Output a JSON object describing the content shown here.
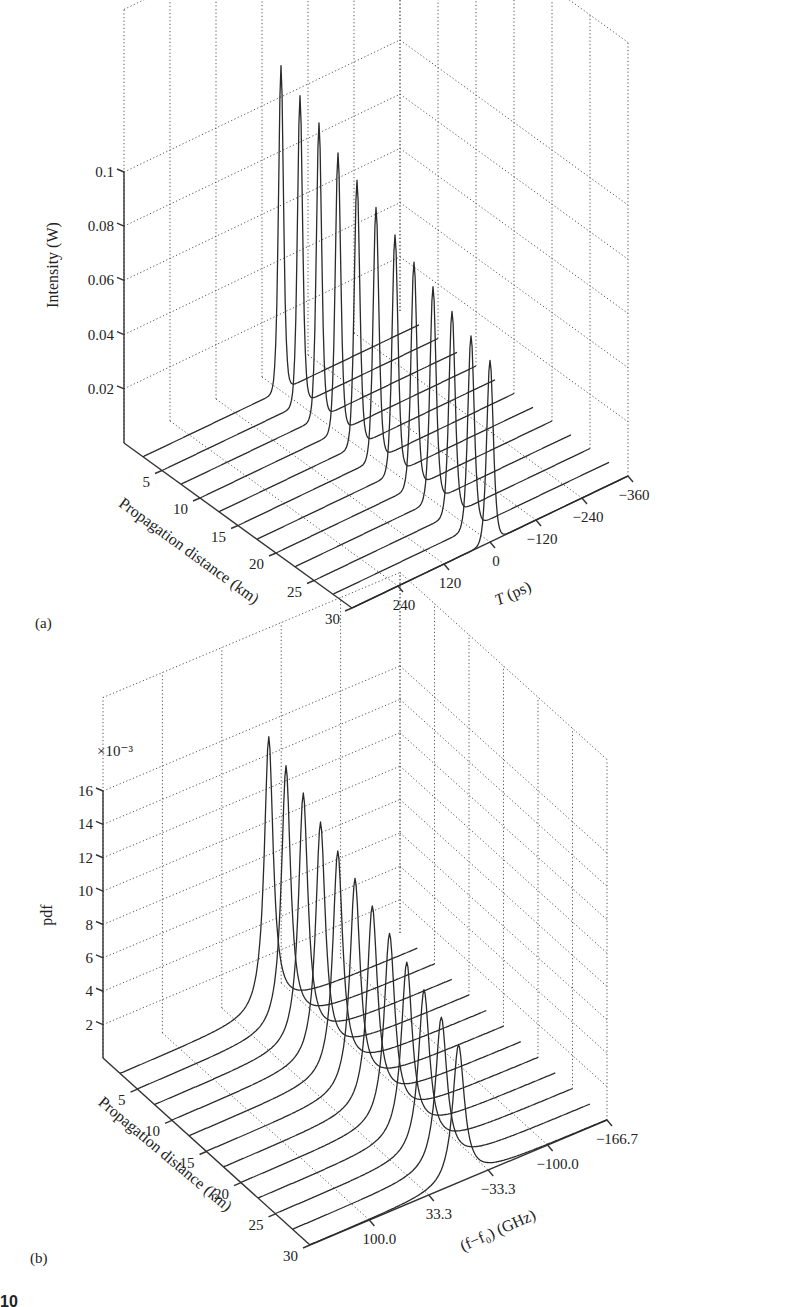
{
  "chart_data": [
    {
      "type": "waterfall-3d",
      "panel": "(a)",
      "zlabel": "Intensity (W)",
      "ylabel": "Propagation distance (km)",
      "xlabel": "T (ps)",
      "z_ticks": [
        "0.02",
        "0.04",
        "0.06",
        "0.08",
        "0.1"
      ],
      "z_tick_values": [
        0.02,
        0.04,
        0.06,
        0.08,
        0.1
      ],
      "y_ticks": [
        "5",
        "10",
        "15",
        "20",
        "25",
        "30"
      ],
      "x_ticks": [
        "240",
        "120",
        "0",
        "−120",
        "−240",
        "−360"
      ],
      "zlim": [
        0,
        0.1
      ],
      "ylim": [
        0,
        30
      ],
      "xlim": [
        360,
        -360
      ],
      "series": [
        {
          "distance_km": 2.5,
          "peak_W": 0.12,
          "center_ps": 0
        },
        {
          "distance_km": 5.0,
          "peak_W": 0.114,
          "center_ps": 0
        },
        {
          "distance_km": 7.5,
          "peak_W": 0.109,
          "center_ps": 0
        },
        {
          "distance_km": 10.0,
          "peak_W": 0.103,
          "center_ps": 0
        },
        {
          "distance_km": 12.5,
          "peak_W": 0.098,
          "center_ps": 0
        },
        {
          "distance_km": 15.0,
          "peak_W": 0.093,
          "center_ps": 0
        },
        {
          "distance_km": 17.5,
          "peak_W": 0.088,
          "center_ps": 0
        },
        {
          "distance_km": 20.0,
          "peak_W": 0.083,
          "center_ps": 0
        },
        {
          "distance_km": 22.5,
          "peak_W": 0.079,
          "center_ps": 0
        },
        {
          "distance_km": 25.0,
          "peak_W": 0.075,
          "center_ps": 0
        },
        {
          "distance_km": 27.5,
          "peak_W": 0.071,
          "center_ps": 0
        },
        {
          "distance_km": 30.0,
          "peak_W": 0.067,
          "center_ps": 0
        }
      ],
      "grid": true
    },
    {
      "type": "waterfall-3d",
      "panel": "(b)",
      "zlabel": "pdf",
      "z_multiplier": "×10⁻³",
      "ylabel": "Propagation distance (km)",
      "xlabel": "(f−f₀) (GHz)",
      "z_ticks": [
        "2",
        "4",
        "6",
        "8",
        "10",
        "12",
        "14",
        "16"
      ],
      "z_tick_values": [
        2,
        4,
        6,
        8,
        10,
        12,
        14,
        16
      ],
      "y_ticks": [
        "5",
        "10",
        "15",
        "20",
        "25",
        "30"
      ],
      "x_ticks": [
        "100.0",
        "33.3",
        "−33.3",
        "−100.0",
        "−166.7"
      ],
      "zlim": [
        0,
        18
      ],
      "ylim": [
        0,
        30
      ],
      "xlim": [
        166.7,
        -166.7
      ],
      "series": [
        {
          "distance_km": 2.5,
          "peak_e3": 18.5,
          "center_GHz": 0
        },
        {
          "distance_km": 5.0,
          "peak_e3": 17.6,
          "center_GHz": 0
        },
        {
          "distance_km": 7.5,
          "peak_e3": 16.8,
          "center_GHz": 0
        },
        {
          "distance_km": 10.0,
          "peak_e3": 15.9,
          "center_GHz": 0
        },
        {
          "distance_km": 12.5,
          "peak_e3": 15.0,
          "center_GHz": 0
        },
        {
          "distance_km": 15.0,
          "peak_e3": 14.2,
          "center_GHz": 0
        },
        {
          "distance_km": 17.5,
          "peak_e3": 13.4,
          "center_GHz": 0
        },
        {
          "distance_km": 20.0,
          "peak_e3": 12.6,
          "center_GHz": 0
        },
        {
          "distance_km": 22.5,
          "peak_e3": 11.7,
          "center_GHz": 0
        },
        {
          "distance_km": 25.0,
          "peak_e3": 10.9,
          "center_GHz": 0
        },
        {
          "distance_km": 27.5,
          "peak_e3": 10.1,
          "center_GHz": 0
        },
        {
          "distance_km": 30.0,
          "peak_e3": 9.3,
          "center_GHz": 0
        }
      ],
      "grid": true
    }
  ],
  "panels": {
    "a": {
      "label": "(a)",
      "zlabel": "Intensity (W)",
      "ylabel": "Propagation distance (km)",
      "xlabel_italic": "T",
      "xlabel_rest": " (ps)",
      "z_ticks": [
        "0.02",
        "0.04",
        "0.06",
        "0.08",
        "0.1"
      ],
      "y_ticks": [
        "5",
        "10",
        "15",
        "20",
        "25",
        "30"
      ],
      "x_ticks": [
        "240",
        "120",
        "0",
        "−120",
        "−240",
        "−360"
      ]
    },
    "b": {
      "label": "(b)",
      "zlabel": "pdf",
      "multiplier": "×10⁻³",
      "ylabel": "Propagation distance (km)",
      "xlabel": "(f−f₀) (GHz)",
      "z_ticks": [
        "2",
        "4",
        "6",
        "8",
        "10",
        "12",
        "14",
        "16"
      ],
      "y_ticks": [
        "5",
        "10",
        "15",
        "20",
        "25",
        "30"
      ],
      "x_ticks": [
        "100.0",
        "33.3",
        "−33.3",
        "−100.0",
        "−166.7"
      ]
    }
  },
  "footer_fragment": "10"
}
